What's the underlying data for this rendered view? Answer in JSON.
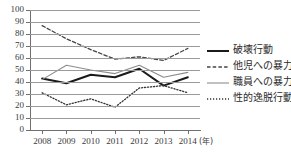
{
  "chart_data": {
    "type": "line",
    "title": "",
    "subtitle": "",
    "xlabel": "(年)",
    "ylabel": "",
    "x": [
      "2008",
      "2009",
      "2010",
      "2011",
      "2012",
      "2013",
      "2014"
    ],
    "categories": [
      "2008",
      "2009",
      "2010",
      "2011",
      "2012",
      "2013",
      "2014"
    ],
    "ylim": [
      0,
      100
    ],
    "yticks": [
      0,
      10,
      20,
      30,
      40,
      50,
      60,
      70,
      80,
      90,
      100
    ],
    "ytick_labels": [
      "0",
      "10",
      "20",
      "30",
      "40",
      "50",
      "60",
      "70",
      "80",
      "90",
      "100"
    ],
    "grid": "horizontal",
    "legend_position": "right",
    "series": [
      {
        "name": "破壊行動",
        "style": "solid-thick",
        "color": "#1a1a1a",
        "values": [
          43,
          39,
          46,
          44,
          51,
          37,
          44
        ]
      },
      {
        "name": "他児への暴力",
        "style": "dashed",
        "color": "#444444",
        "values": [
          87,
          76,
          67,
          59,
          61,
          58,
          68
        ]
      },
      {
        "name": "職員への暴力",
        "style": "solid-thin",
        "color": "#8c8c8c",
        "values": [
          42,
          54,
          50,
          47,
          54,
          44,
          48
        ]
      },
      {
        "name": "性的逸脱行動",
        "style": "dotted",
        "color": "#333333",
        "values": [
          31,
          21,
          26,
          19,
          35,
          37,
          31
        ]
      }
    ]
  },
  "axis": {
    "x_unit_label": "(年)"
  },
  "legend": {
    "items": [
      {
        "label": "破壊行動"
      },
      {
        "label": "他児への暴力"
      },
      {
        "label": "職員への暴力"
      },
      {
        "label": "性的逸脱行動"
      }
    ]
  }
}
